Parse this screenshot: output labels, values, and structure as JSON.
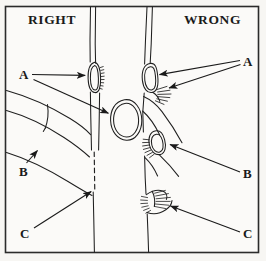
{
  "figure": {
    "background_color": "#f7f6f3",
    "ink_color": "#1a1a1a",
    "border": {
      "color": "#2b2b2b",
      "width_px": 1.6
    },
    "headings": {
      "left": "RIGHT",
      "right": "WRONG"
    },
    "labels": {
      "left_a": "A",
      "left_b": "B",
      "left_c": "C",
      "right_a": "A",
      "right_b": "B",
      "right_c": "C"
    },
    "panels": [
      {
        "name": "right-panel",
        "heading": "RIGHT",
        "callouts": [
          {
            "letter": "A",
            "target": "bud-patch-seated-flush-in-stem"
          },
          {
            "letter": "A",
            "target": "detached-bud-shield-oval"
          },
          {
            "letter": "B",
            "target": "clean-cut-branch-stub-notch"
          },
          {
            "letter": "C",
            "target": "dashed-cut-line-on-stem"
          }
        ]
      },
      {
        "name": "wrong-panel",
        "heading": "WRONG",
        "callouts": [
          {
            "letter": "A",
            "target": "bud-patch-proud-with-torn-edge"
          },
          {
            "letter": "B",
            "target": "bud-patch-ragged-frayed-margin"
          },
          {
            "letter": "C",
            "target": "torn-stripped-bark-wound"
          }
        ]
      }
    ]
  }
}
